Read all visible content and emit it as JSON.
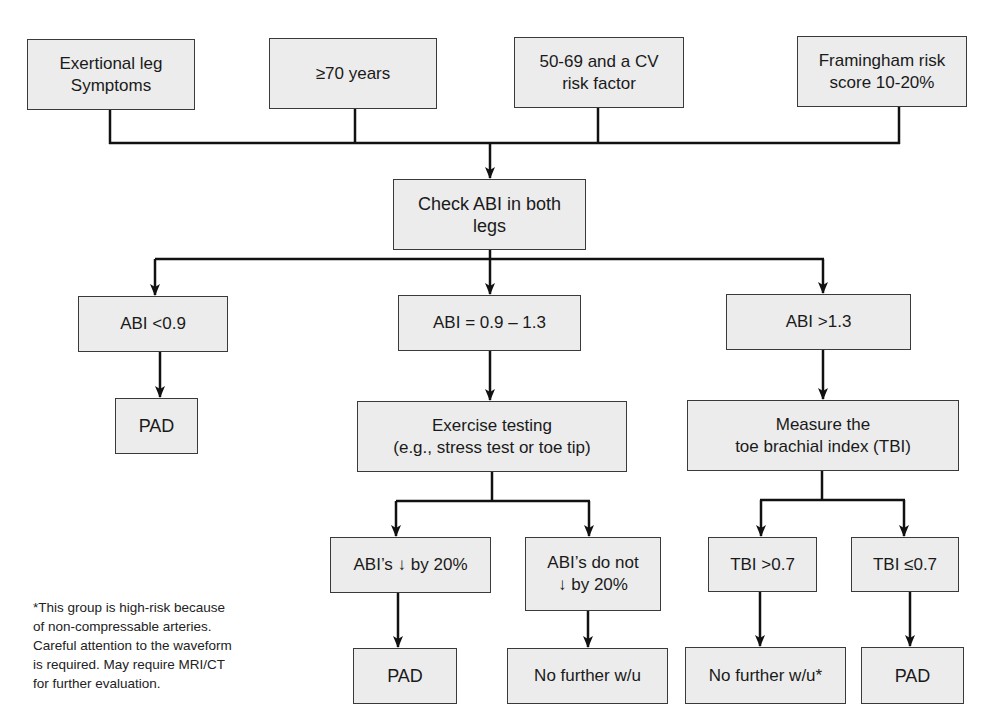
{
  "diagram": {
    "type": "flowchart",
    "colors": {
      "box_fill": "#ececec",
      "box_border": "#3a3a3a",
      "line": "#111111"
    },
    "entry_criteria": [
      {
        "id": "exertional",
        "label": "Exertional leg\nSymptoms"
      },
      {
        "id": "age70",
        "label": "≥70 years"
      },
      {
        "id": "age50",
        "label": "50-69 and a CV\nrisk factor"
      },
      {
        "id": "framingham",
        "label": "Framingham risk\nscore 10-20%"
      }
    ],
    "check_abi": {
      "label": "Check ABI in both\nlegs"
    },
    "abi_branches": {
      "low": {
        "label": "ABI <0.9",
        "result": "PAD"
      },
      "normal": {
        "label": "ABI = 0.9 – 1.3",
        "next": "Exercise testing\n(e.g., stress test or toe tip)",
        "outcomes": [
          {
            "label": "ABI’s ↓ by 20%",
            "result": "PAD"
          },
          {
            "label": "ABI’s do not\n↓ by 20%",
            "result": "No further w/u"
          }
        ]
      },
      "high": {
        "label": "ABI >1.3",
        "next": "Measure the\ntoe brachial index (TBI)",
        "outcomes": [
          {
            "label": "TBI >0.7",
            "result": "No further w/u*"
          },
          {
            "label": "TBI ≤0.7",
            "result": "PAD"
          }
        ]
      }
    },
    "footnote": "*This group is high-risk because\nof non-compressable arteries.\nCareful attention to the waveform\nis required. May require MRI/CT\nfor further evaluation."
  }
}
